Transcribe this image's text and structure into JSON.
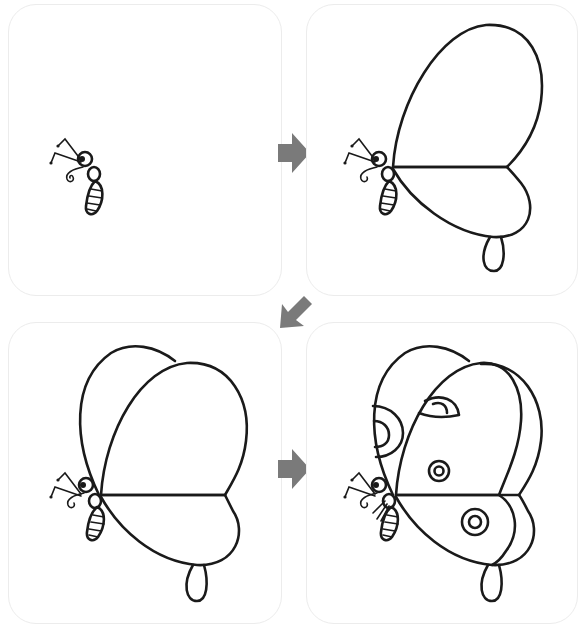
{
  "title": "How to draw a butterfly",
  "steps": [
    {
      "number": "1",
      "label": "Step 1: body, head, antennae and proboscis"
    },
    {
      "number": "2",
      "label": "Step 2: front wing and hind wing with tail"
    },
    {
      "number": "3",
      "label": "Step 3: add second front wing"
    },
    {
      "number": "4",
      "label": "Step 4: add wing borders, eyespots and legs"
    }
  ],
  "arrows": [
    {
      "direction": "right",
      "from": "1",
      "to": "2"
    },
    {
      "direction": "down-left",
      "from": "2",
      "to": "3"
    },
    {
      "direction": "right",
      "from": "3",
      "to": "4"
    }
  ],
  "colors": {
    "line": "#1a1a1a",
    "arrow": "#7a7a7a",
    "panel_border": "#ececec",
    "background": "#ffffff"
  }
}
